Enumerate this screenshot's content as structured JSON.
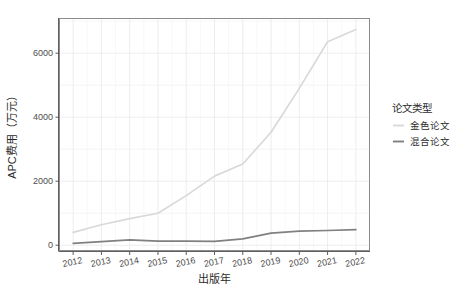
{
  "chart_data": {
    "type": "line",
    "title": "",
    "xlabel": "出版年",
    "ylabel": "APC费用（万元）",
    "x": [
      2012,
      2013,
      2014,
      2015,
      2016,
      2017,
      2018,
      2019,
      2020,
      2021,
      2022
    ],
    "xticklabels": [
      "2012",
      "2013",
      "2014",
      "2015",
      "2016",
      "2017",
      "2018",
      "2019",
      "2020",
      "2021",
      "2022"
    ],
    "yticklabels": [
      "0",
      "2000",
      "4000",
      "6000"
    ],
    "yticks": [
      0,
      2000,
      4000,
      6000
    ],
    "ylim": [
      -180,
      7100
    ],
    "xlim": [
      2011.5,
      2022.5
    ],
    "grid": true,
    "legend_position": "right",
    "series": [
      {
        "name": "金色论文",
        "color": "#d9d9d9",
        "values": [
          400,
          640,
          830,
          1000,
          1550,
          2160,
          2540,
          3530,
          4900,
          6360,
          6740
        ]
      },
      {
        "name": "混合论文",
        "color": "#808080",
        "values": [
          60,
          110,
          170,
          130,
          130,
          120,
          200,
          380,
          440,
          460,
          490
        ]
      }
    ]
  },
  "legend": {
    "title": "论文类型",
    "items": [
      {
        "label": "金色论文",
        "color": "#d9d9d9"
      },
      {
        "label": "混合论文",
        "color": "#808080"
      }
    ]
  },
  "axes": {
    "x_title": "出版年",
    "y_title": "APC费用（万元）"
  }
}
